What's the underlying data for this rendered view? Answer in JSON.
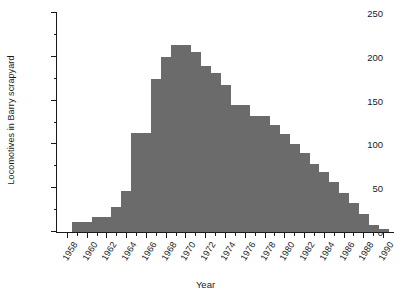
{
  "chart_data": {
    "type": "bar",
    "title": "",
    "xlabel": "Year",
    "ylabel": "Locomotives in Barry scrapyard",
    "xlim": [
      1957,
      1991
    ],
    "ylim": [
      0,
      250
    ],
    "grid": false,
    "legend": null,
    "bar_color": "#6b6b6b",
    "axis_color": "#1a1a1a",
    "background": "#ffffff",
    "y_ticks_major": [
      0,
      50,
      100,
      150,
      200,
      250
    ],
    "y_ticks_minor": [
      25,
      75,
      125,
      175,
      225
    ],
    "x_ticks_major": [
      1958,
      1960,
      1962,
      1964,
      1966,
      1968,
      1970,
      1972,
      1974,
      1976,
      1978,
      1980,
      1982,
      1984,
      1986,
      1988,
      1990
    ],
    "x_ticks_minor": [
      1959,
      1961,
      1963,
      1965,
      1967,
      1969,
      1971,
      1973,
      1975,
      1977,
      1979,
      1981,
      1983,
      1985,
      1987,
      1989
    ],
    "categories": [
      1958,
      1959,
      1960,
      1961,
      1962,
      1963,
      1964,
      1965,
      1966,
      1967,
      1968,
      1969,
      1970,
      1971,
      1972,
      1973,
      1974,
      1975,
      1976,
      1977,
      1978,
      1979,
      1980,
      1981,
      1982,
      1983,
      1984,
      1985,
      1986,
      1987,
      1988,
      1989,
      1990
    ],
    "values": [
      0,
      12,
      12,
      17,
      17,
      28,
      47,
      113,
      113,
      175,
      200,
      213,
      213,
      205,
      190,
      182,
      168,
      145,
      145,
      132,
      132,
      122,
      112,
      100,
      90,
      78,
      68,
      57,
      45,
      33,
      20,
      8,
      3
    ]
  },
  "axis": {
    "y_title": "Locomotives in Barry scrapyard",
    "x_title": "Year"
  }
}
